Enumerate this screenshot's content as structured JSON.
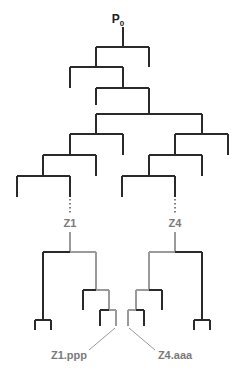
{
  "diagram": {
    "type": "tree",
    "colors": {
      "black_line": "#2a2a2a",
      "gray_line": "#9a9a9a",
      "gray_text": "#7a7a7a",
      "root_text": "#222222"
    },
    "root": {
      "label": "P",
      "subscript": "0"
    },
    "midlabels": [
      {
        "id": "z1",
        "label": "Z1"
      },
      {
        "id": "z4",
        "label": "Z4"
      }
    ],
    "leaf_labels": [
      {
        "id": "z1ppp",
        "label": "Z1.ppp"
      },
      {
        "id": "z4aaa",
        "label": "Z4.aaa"
      }
    ]
  }
}
